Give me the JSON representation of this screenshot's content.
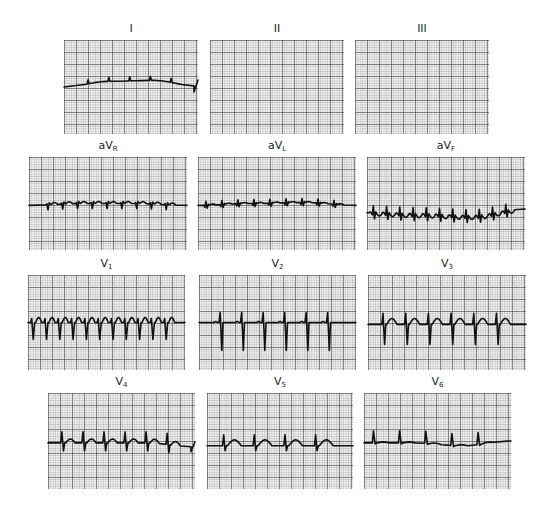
{
  "figure": {
    "type": "12-lead electrocardiogram",
    "leads": [
      {
        "id": "I",
        "label": "I",
        "sub": "",
        "x": 64,
        "y": 40,
        "w": 134,
        "h": 94,
        "baseline": 0.5,
        "drift": [
          0,
          -0.06,
          -0.07,
          -0.01
        ],
        "beats": 5,
        "pattern": "tiny",
        "qrs_up": 4,
        "qrs_down": 0,
        "t": 0,
        "p": 0,
        "rate_offset": 0.18,
        "end_step": -6
      },
      {
        "id": "II",
        "label": "II",
        "sub": "",
        "x": 210,
        "y": 40,
        "w": 134,
        "h": 94,
        "baseline": 0.5,
        "drift": [
          0,
          0,
          0,
          0
        ],
        "beats": 8,
        "pattern": "low-rsr",
        "qrs_up": 6,
        "qrs_down": 5,
        "t": -2,
        "p": 1,
        "rate_offset": 0.02,
        "end_step": 0
      },
      {
        "id": "III",
        "label": "III",
        "sub": "",
        "x": 355,
        "y": 40,
        "w": 134,
        "h": 94,
        "baseline": 0.48,
        "drift": [
          0,
          0.03,
          0.05,
          -0.02
        ],
        "beats": 10,
        "pattern": "low-rsr",
        "qrs_up": 6,
        "qrs_down": 6,
        "t": -3,
        "p": 1,
        "rate_offset": 0.02,
        "end_step": 0
      },
      {
        "id": "aVR",
        "label": "aV",
        "sub": "R",
        "x": 29,
        "y": 157,
        "w": 158,
        "h": 93,
        "baseline": 0.52,
        "drift": [
          0,
          -0.02,
          -0.02,
          0
        ],
        "beats": 9,
        "pattern": "small-q",
        "qrs_up": 2,
        "qrs_down": 5,
        "t": 2,
        "p": 0,
        "rate_offset": 0.12,
        "end_step": 0
      },
      {
        "id": "aVL",
        "label": "aV",
        "sub": "L",
        "x": 198,
        "y": 157,
        "w": 158,
        "h": 93,
        "baseline": 0.52,
        "drift": [
          0,
          -0.02,
          -0.03,
          0
        ],
        "beats": 9,
        "pattern": "low-rsr",
        "qrs_up": 4,
        "qrs_down": 3,
        "t": 1,
        "p": 0,
        "rate_offset": 0.05,
        "end_step": 0
      },
      {
        "id": "aVF",
        "label": "aV",
        "sub": "F",
        "x": 367,
        "y": 157,
        "w": 158,
        "h": 93,
        "baseline": 0.6,
        "drift": [
          0,
          0.02,
          0.04,
          -0.04
        ],
        "beats": 11,
        "pattern": "low-rsr",
        "qrs_up": 7,
        "qrs_down": 6,
        "t": -3,
        "p": 1,
        "rate_offset": 0.04,
        "end_step": 0
      },
      {
        "id": "V1",
        "label": "V",
        "sub": "1",
        "x": 28,
        "y": 275,
        "w": 157,
        "h": 95,
        "baseline": 0.5,
        "drift": [
          0,
          0,
          0,
          0
        ],
        "beats": 11,
        "pattern": "rS",
        "qrs_up": 4,
        "qrs_down": 17,
        "t": 5,
        "p": 0,
        "rate_offset": 0.03,
        "end_step": 0
      },
      {
        "id": "V2",
        "label": "V",
        "sub": "2",
        "x": 199,
        "y": 275,
        "w": 157,
        "h": 95,
        "baseline": 0.5,
        "drift": [
          0,
          0,
          0,
          0
        ],
        "beats": 6,
        "pattern": "RS",
        "qrs_up": 10,
        "qrs_down": 28,
        "t": 0,
        "p": 1,
        "rate_offset": 0.14,
        "end_step": 0
      },
      {
        "id": "V3",
        "label": "V",
        "sub": "3",
        "x": 368,
        "y": 275,
        "w": 158,
        "h": 95,
        "baseline": 0.52,
        "drift": [
          0,
          0,
          0,
          0
        ],
        "beats": 6,
        "pattern": "RS-t",
        "qrs_up": 11,
        "qrs_down": 20,
        "t": 6,
        "p": 0,
        "rate_offset": 0.1,
        "end_step": 0
      },
      {
        "id": "V4",
        "label": "V",
        "sub": "4",
        "x": 48,
        "y": 393,
        "w": 147,
        "h": 96,
        "baseline": 0.52,
        "drift": [
          0,
          0,
          0,
          0.04
        ],
        "beats": 6,
        "pattern": "RS-t",
        "qrs_up": 11,
        "qrs_down": 8,
        "t": 4,
        "p": 0,
        "rate_offset": 0.1,
        "end_step": -5
      },
      {
        "id": "V5",
        "label": "V",
        "sub": "5",
        "x": 207,
        "y": 393,
        "w": 146,
        "h": 96,
        "baseline": 0.55,
        "drift": [
          0,
          0,
          0,
          0
        ],
        "beats": 4,
        "pattern": "Rs-t",
        "qrs_up": 11,
        "qrs_down": 5,
        "t": 6,
        "p": 0,
        "rate_offset": 0.12,
        "end_step": 0
      },
      {
        "id": "V6",
        "label": "V",
        "sub": "6",
        "x": 364,
        "y": 393,
        "w": 147,
        "h": 96,
        "baseline": 0.52,
        "drift": [
          0,
          0,
          0.03,
          -0.02
        ],
        "beats": 5,
        "pattern": "R",
        "qrs_up": 12,
        "qrs_down": 0,
        "t": 1,
        "p": 0,
        "rate_offset": 0.07,
        "end_step": 0
      }
    ]
  },
  "colors": {
    "background": "#ffffff",
    "paper": "#f2f2f2",
    "grid_major": "#6a6a6a",
    "grid_minor": "#b5b5b5",
    "trace": "#111111",
    "label": "#222222"
  }
}
